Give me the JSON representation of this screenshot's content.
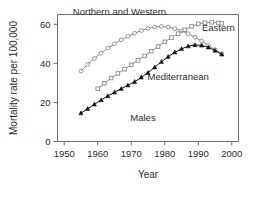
{
  "chart_data": {
    "type": "line",
    "title": "",
    "subtitle": "",
    "xlabel": "Year",
    "ylabel": "Mortality rate per 100,000",
    "xlim": [
      1948,
      2002
    ],
    "ylim": [
      0,
      65
    ],
    "xticks": [
      1950,
      1960,
      1970,
      1980,
      1990,
      2000
    ],
    "yticks": [
      0,
      20,
      40,
      60
    ],
    "xtick_labels": [
      "1950",
      "1960",
      "1970",
      "1980",
      "1990",
      "2000"
    ],
    "ytick_labels": [
      "0",
      "20",
      "40",
      "60"
    ],
    "grid": false,
    "legend_position": "inline-annotations",
    "annotations": [
      {
        "text": "Northern and Western",
        "x": 1966.5,
        "y": 64.5
      },
      {
        "text": "Eastern",
        "x": 1996.0,
        "y": 56.5
      },
      {
        "text": "Mediterranean",
        "x": 1984.0,
        "y": 31.5
      },
      {
        "text": "Males",
        "x": 1973.5,
        "y": 10.5
      }
    ],
    "series": [
      {
        "name": "Northern and Western",
        "marker": "open-circle",
        "color": "#8a8a8a",
        "x": [
          1955,
          1957,
          1959,
          1961,
          1963,
          1965,
          1967,
          1969,
          1971,
          1973,
          1975,
          1977,
          1979,
          1981,
          1983,
          1985,
          1987,
          1989,
          1991,
          1993,
          1995,
          1997
        ],
        "values": [
          36.0,
          39.5,
          42.5,
          45.2,
          47.8,
          50.0,
          52.0,
          53.8,
          55.4,
          56.8,
          57.9,
          58.6,
          58.9,
          58.6,
          57.8,
          56.6,
          55.1,
          53.4,
          51.4,
          49.2,
          47.0,
          45.0
        ]
      },
      {
        "name": "Eastern",
        "marker": "open-square",
        "color": "#8a8a8a",
        "x": [
          1960,
          1962,
          1964,
          1966,
          1968,
          1970,
          1972,
          1974,
          1976,
          1978,
          1980,
          1982,
          1984,
          1986,
          1988,
          1990,
          1992,
          1994,
          1996,
          1997
        ],
        "values": [
          27.0,
          29.8,
          32.5,
          34.8,
          37.0,
          39.2,
          41.5,
          43.8,
          46.2,
          48.6,
          51.0,
          53.2,
          55.2,
          57.2,
          58.9,
          60.2,
          60.8,
          61.0,
          60.7,
          60.5
        ]
      },
      {
        "name": "Mediterranean",
        "marker": "filled-triangle",
        "color": "#111111",
        "x": [
          1955,
          1957,
          1959,
          1961,
          1963,
          1965,
          1967,
          1969,
          1971,
          1973,
          1975,
          1977,
          1979,
          1981,
          1983,
          1985,
          1987,
          1989,
          1991,
          1993,
          1995,
          1997
        ],
        "values": [
          14.5,
          16.8,
          19.0,
          21.2,
          23.3,
          25.2,
          27.0,
          28.8,
          30.6,
          32.8,
          35.2,
          38.0,
          40.8,
          43.4,
          45.6,
          47.4,
          48.8,
          49.4,
          49.2,
          48.2,
          46.6,
          44.6
        ]
      }
    ]
  }
}
